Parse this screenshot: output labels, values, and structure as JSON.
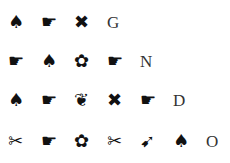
{
  "rows": [
    {
      "symbols": [
        {
          "name": "spade-icon",
          "glyph": "♠"
        },
        {
          "name": "pointing-hand-icon",
          "glyph": "☛"
        },
        {
          "name": "heavy-x-icon",
          "glyph": "✖"
        }
      ],
      "letter": "G"
    },
    {
      "symbols": [
        {
          "name": "pointing-hand-icon",
          "glyph": "☛"
        },
        {
          "name": "spade-icon",
          "glyph": "♠"
        },
        {
          "name": "flower-icon",
          "glyph": "✿"
        },
        {
          "name": "pointing-hand-icon",
          "glyph": "☛"
        }
      ],
      "letter": "N"
    },
    {
      "symbols": [
        {
          "name": "spade-icon",
          "glyph": "♠"
        },
        {
          "name": "pointing-hand-icon",
          "glyph": "☛"
        },
        {
          "name": "floral-heart-icon",
          "glyph": "❦"
        },
        {
          "name": "heavy-x-icon",
          "glyph": "✖"
        },
        {
          "name": "pointing-hand-icon",
          "glyph": "☛"
        }
      ],
      "letter": "D"
    },
    {
      "symbols": [
        {
          "name": "scissors-icon",
          "glyph": "✂"
        },
        {
          "name": "pointing-hand-icon",
          "glyph": "☛"
        },
        {
          "name": "flower-icon",
          "glyph": "✿"
        },
        {
          "name": "scissors-icon",
          "glyph": "✂"
        },
        {
          "name": "feathered-arrow-icon",
          "glyph": "➹"
        },
        {
          "name": "spade-icon",
          "glyph": "♠"
        }
      ],
      "letter": "O"
    }
  ]
}
